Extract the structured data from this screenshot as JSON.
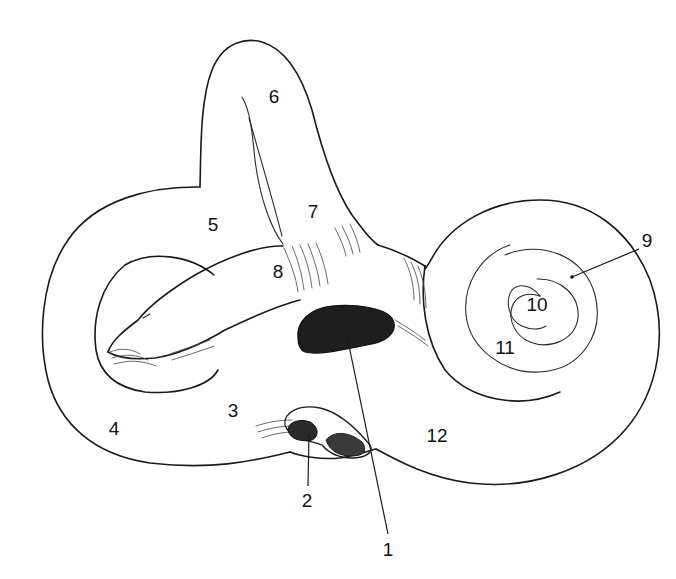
{
  "figure": {
    "colors": {
      "ink": "#1a1a1a",
      "background": "#ffffff",
      "window_fill": "#1e1e1e"
    }
  },
  "labels": [
    {
      "id": "1",
      "text": "1",
      "x": 388,
      "y": 549,
      "leader": {
        "x1": 388,
        "y1": 534,
        "x2": 347,
        "y2": 336
      }
    },
    {
      "id": "2",
      "text": "2",
      "x": 307,
      "y": 500,
      "leader": {
        "x1": 308,
        "y1": 486,
        "x2": 309,
        "y2": 434
      }
    },
    {
      "id": "3",
      "text": "3",
      "x": 233,
      "y": 410
    },
    {
      "id": "4",
      "text": "4",
      "x": 114,
      "y": 428
    },
    {
      "id": "5",
      "text": "5",
      "x": 213,
      "y": 224
    },
    {
      "id": "6",
      "text": "6",
      "x": 274,
      "y": 96
    },
    {
      "id": "7",
      "text": "7",
      "x": 313,
      "y": 211
    },
    {
      "id": "8",
      "text": "8",
      "x": 278,
      "y": 271
    },
    {
      "id": "9",
      "text": "9",
      "x": 647,
      "y": 240,
      "leader": {
        "x1": 639,
        "y1": 249,
        "x2": 572,
        "y2": 277
      }
    },
    {
      "id": "10",
      "text": "10",
      "x": 537,
      "y": 304
    },
    {
      "id": "11",
      "text": "11",
      "x": 505,
      "y": 347
    },
    {
      "id": "12",
      "text": "12",
      "x": 437,
      "y": 435
    }
  ]
}
